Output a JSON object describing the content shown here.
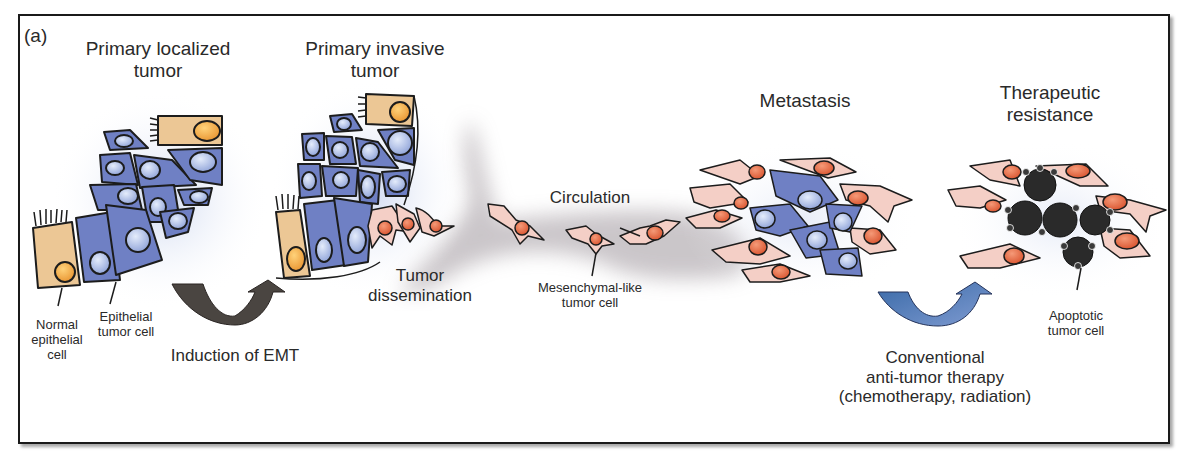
{
  "panel_label": "(a)",
  "stages": {
    "primary_localized": {
      "line1": "Primary localized",
      "line2": "tumor"
    },
    "primary_invasive": {
      "line1": "Primary invasive",
      "line2": "tumor"
    },
    "metastasis": {
      "line1": "Metastasis"
    },
    "therapeutic_resistance": {
      "line1": "Therapeutic",
      "line2": "resistance"
    }
  },
  "labels": {
    "normal_epithelial_cell": {
      "line1": "Normal",
      "line2": "epithelial",
      "line3": "cell"
    },
    "epithelial_tumor_cell": {
      "line1": "Epithelial",
      "line2": "tumor cell"
    },
    "induction_of_emt": "Induction of EMT",
    "tumor_dissemination": {
      "line1": "Tumor",
      "line2": "dissemination"
    },
    "circulation": "Circulation",
    "mesenchymal_like_tumor_cell": {
      "line1": "Mesenchymal-like",
      "line2": "tumor cell"
    },
    "apoptotic_tumor_cell": {
      "line1": "Apoptotic",
      "line2": "tumor cell"
    },
    "therapy": {
      "line1": "Conventional",
      "line2": "anti-tumor therapy",
      "line3": "(chemotherapy, radiation)"
    }
  },
  "colors": {
    "epithelial_blue": "#6f80c4",
    "nucleus_blue": "#9fb1e0",
    "normal_cell_tan": "#ecc795",
    "normal_nucleus_orange": "#f0a43c",
    "mesenchymal_pink": "#f4cfc6",
    "mesenchymal_nucleus": "#e0643e",
    "emt_arrow": "#4a4541",
    "therapy_arrow": "#5a73b3",
    "apoptotic_dark": "#2a2a2a",
    "circulation_gray": "#b9b3b8"
  }
}
